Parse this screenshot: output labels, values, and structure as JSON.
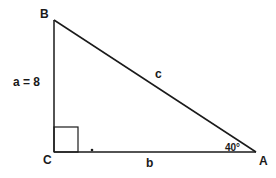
{
  "diagram": {
    "type": "right-triangle",
    "vertices": {
      "A": {
        "label": "A"
      },
      "B": {
        "label": "B"
      },
      "C": {
        "label": "C"
      }
    },
    "sides": {
      "a": {
        "label": "a = 8",
        "name": "a",
        "value": "8"
      },
      "b": {
        "label": "b"
      },
      "c": {
        "label": "c"
      }
    },
    "angle_A": {
      "label": "40°"
    },
    "right_angle_at": "C",
    "colors": {
      "stroke": "#1a1a1a",
      "background": "#ffffff"
    }
  }
}
